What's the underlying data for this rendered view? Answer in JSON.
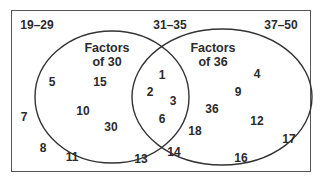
{
  "ranges": {
    "left": "19–29",
    "middle": "31–35",
    "right": "37–50"
  },
  "sets": {
    "a": {
      "title_line1": "Factors",
      "title_line2": "of 30"
    },
    "b": {
      "title_line1": "Factors",
      "title_line2": "of 36"
    }
  },
  "colors": {
    "stroke": "#333333",
    "text": "#2b2b2b",
    "frame": "#555555"
  },
  "numbers": {
    "only_a": [
      "5",
      "15",
      "10",
      "30"
    ],
    "both": [
      "1",
      "2",
      "3",
      "6"
    ],
    "only_b": [
      "4",
      "9",
      "36",
      "12",
      "18"
    ],
    "neither": [
      "7",
      "8",
      "11",
      "13",
      "14",
      "16",
      "17"
    ]
  }
}
